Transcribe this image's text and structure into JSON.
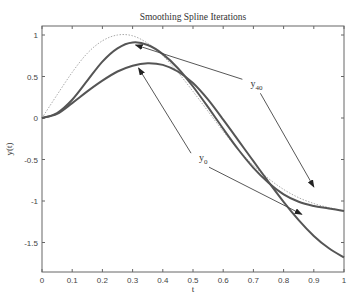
{
  "chart_data": {
    "type": "line",
    "title": "Smoothing Spline Iterations",
    "xlabel": "t",
    "ylabel": "y(t)",
    "xlim": [
      0,
      1
    ],
    "ylim": [
      -1.8,
      1.1
    ],
    "xticks": [
      "0",
      "0.1",
      "0.2",
      "0.3",
      "0.4",
      "0.5",
      "0.6",
      "0.7",
      "0.8",
      "0.9",
      "1"
    ],
    "yticks": [
      "1",
      "0.5",
      "0",
      "-0.5",
      "-1",
      "-1.5"
    ],
    "grid": false,
    "x": [
      0,
      0.05,
      0.1,
      0.15,
      0.2,
      0.25,
      0.3,
      0.35,
      0.4,
      0.45,
      0.5,
      0.55,
      0.6,
      0.65,
      0.7,
      0.75,
      0.8,
      0.85,
      0.9,
      0.95,
      1.0
    ],
    "series": [
      {
        "name": "true function (dotted)",
        "style": "dotted",
        "values": [
          0,
          0.28,
          0.55,
          0.78,
          0.93,
          1.0,
          0.99,
          0.9,
          0.75,
          0.55,
          0.32,
          0.08,
          -0.16,
          -0.38,
          -0.57,
          -0.73,
          -0.86,
          -0.96,
          -1.03,
          -1.08,
          -1.12
        ]
      },
      {
        "name": "y40",
        "style": "solid",
        "values": [
          0,
          0.06,
          0.22,
          0.45,
          0.68,
          0.84,
          0.91,
          0.88,
          0.77,
          0.6,
          0.38,
          0.13,
          -0.13,
          -0.38,
          -0.6,
          -0.78,
          -0.92,
          -1.01,
          -1.06,
          -1.09,
          -1.12
        ]
      },
      {
        "name": "y0",
        "style": "solid",
        "values": [
          0,
          0.05,
          0.18,
          0.32,
          0.45,
          0.56,
          0.63,
          0.66,
          0.64,
          0.56,
          0.42,
          0.22,
          -0.02,
          -0.27,
          -0.52,
          -0.77,
          -1.01,
          -1.23,
          -1.42,
          -1.57,
          -1.68
        ]
      }
    ],
    "annotations": [
      {
        "label": "y",
        "subscript": "40",
        "x": 0.69,
        "y": 0.37,
        "arrows_to": [
          [
            0.31,
            0.88
          ],
          [
            0.9,
            -0.83
          ]
        ]
      },
      {
        "label": "y",
        "subscript": "0",
        "x": 0.52,
        "y": -0.52,
        "arrows_to": [
          [
            0.32,
            0.6
          ],
          [
            0.86,
            -1.16
          ]
        ]
      }
    ]
  }
}
